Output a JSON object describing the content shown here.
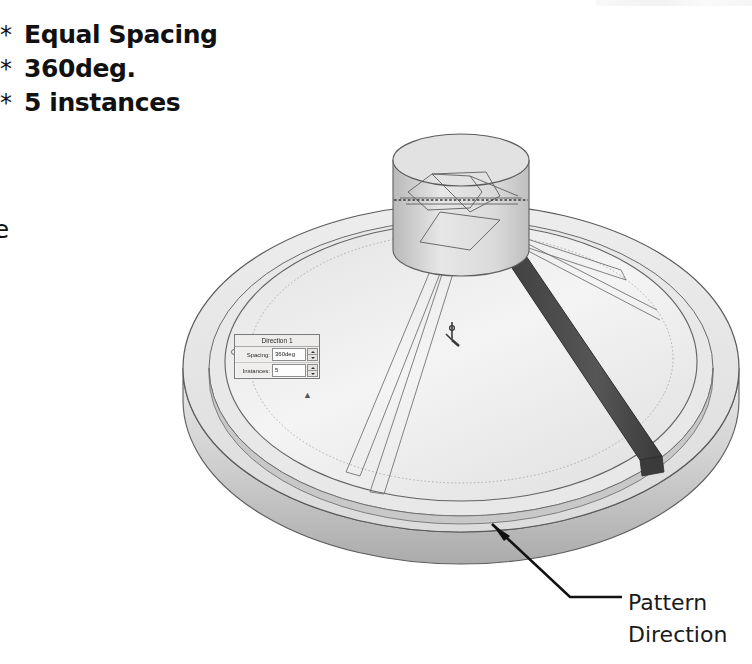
{
  "page": {
    "background": "#ffffff",
    "width": 752,
    "height": 664
  },
  "instructions": {
    "bullets": [
      {
        "marker": "*",
        "text": "Equal Spacing"
      },
      {
        "marker": "*",
        "text": "360deg."
      },
      {
        "marker": "*",
        "text": "5 instances"
      }
    ],
    "paragraph_lines": [
      "ble the",
      "ies",
      "ckbox",
      "select",
      "Rib",
      "ure."
    ],
    "paragraph_bold_lines": [
      1,
      4
    ],
    "final_line_prefix": "k ",
    "final_line_bold": "OK",
    "final_line_suffix": "."
  },
  "dialog": {
    "title": "Direction 1",
    "rows": [
      {
        "label": "Spacing:",
        "value": "360deg",
        "spinner": "up-down-spinner"
      },
      {
        "label": "Instances:",
        "value": "5",
        "spinner": "up-down-spinner"
      }
    ],
    "collapse_glyph": "▲",
    "colors": {
      "background": "#efeeec",
      "border": "#7a7a7a",
      "field": "#fdfdfd"
    }
  },
  "callout": {
    "line1": "Pattern",
    "line2": "Direction",
    "leader": "arrow-to-outer-rim"
  },
  "model": {
    "description": "Conical disc part with outer rim, central cylindrical hub and a darkened selected rib",
    "colors": {
      "face_light": "#f1f1f1",
      "face_mid": "#dedede",
      "face_shaded": "#bdbdbd",
      "face_dark": "#9c9c9c",
      "rib_selected": "#4d4d4d",
      "outline": "#5a5a5a",
      "preview_line": "#6b6b6b"
    },
    "origin_marker": "origin-axis-glyph"
  }
}
